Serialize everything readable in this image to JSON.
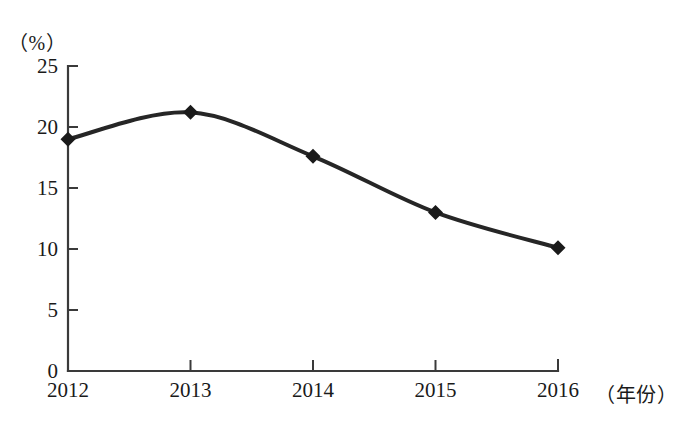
{
  "chart_data": {
    "type": "line",
    "title": "",
    "xlabel": "（年份）",
    "ylabel": "（%）",
    "categories": [
      "2012",
      "2013",
      "2014",
      "2015",
      "2016"
    ],
    "values": [
      19.0,
      21.2,
      17.6,
      13.0,
      10.1
    ],
    "series": [
      {
        "name": "",
        "values": [
          19.0,
          21.2,
          17.6,
          13.0,
          10.1
        ]
      }
    ],
    "ylim": [
      0,
      25
    ],
    "yticks": [
      0,
      5,
      10,
      15,
      20,
      25
    ],
    "ytick_labels": [
      "0",
      "5",
      "10",
      "15",
      "20",
      "25"
    ],
    "xtick_labels": [
      "2012",
      "2013",
      "2014",
      "2015",
      "2016"
    ],
    "grid": false,
    "legend": false,
    "legend_position": "none",
    "marker": "diamond",
    "line_color": "#262626",
    "marker_color": "#1a1a1a",
    "axis_color": "#3a3a3a",
    "background_color": "#ffffff",
    "smooth": true,
    "annotations": []
  },
  "labels": {
    "y_unit": "（%）",
    "x_unit": "（年份）",
    "faint_header": ""
  }
}
